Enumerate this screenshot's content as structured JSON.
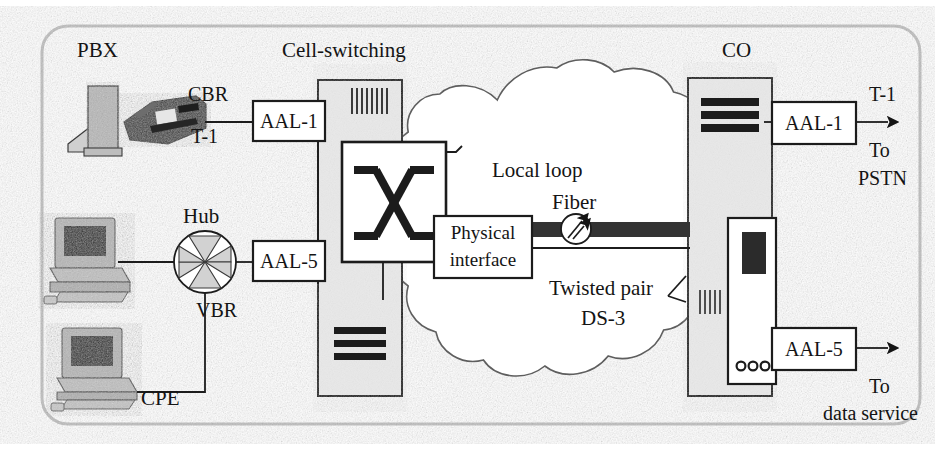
{
  "diagram": {
    "frame": {
      "style": "rounded-rectangle-border",
      "color": "#b9b9b9"
    },
    "labels": {
      "pbx": "PBX",
      "cell_switching": "Cell-switching",
      "co": "CO",
      "hub": "Hub",
      "cpe": "CPE",
      "cbr": "CBR",
      "t1_left": "T-1",
      "vbr": "VBR",
      "local_loop": "Local loop",
      "fiber": "Fiber",
      "twisted_pair": "Twisted pair",
      "ds3": "DS-3",
      "t1_right": "T-1",
      "to_pstn_line1": "To",
      "to_pstn_line2": "PSTN",
      "to_data_line1": "To",
      "to_data_line2": "data service"
    },
    "boxes": {
      "aal1_left": "AAL-1",
      "aal5_left": "AAL-5",
      "physical_interface_line1": "Physical",
      "physical_interface_line2": "interface",
      "aal1_right": "AAL-1",
      "aal5_right": "AAL-5"
    },
    "nodes": [
      {
        "name": "pbx-cabinet",
        "kind": "equipment-cabinet",
        "fill": "#b4b4b4"
      },
      {
        "name": "desk-phone",
        "kind": "telephone",
        "fill": "#3a3a3a"
      },
      {
        "name": "workstation-top",
        "kind": "desktop-computer",
        "fill": "#b0b0b0"
      },
      {
        "name": "workstation-bottom",
        "kind": "desktop-computer",
        "fill": "#b0b0b0"
      },
      {
        "name": "hub",
        "kind": "pinwheel-hub",
        "fill": "#cfcfcf"
      },
      {
        "name": "cell-switching-cabinet",
        "kind": "equipment-cabinet",
        "fill": "#e6e6e6"
      },
      {
        "name": "crossbar-switch",
        "kind": "x-switch",
        "fill": "#ffffff"
      },
      {
        "name": "local-loop-cloud",
        "kind": "network-cloud",
        "fill": "#ffffff"
      },
      {
        "name": "fiber-trunk",
        "kind": "thick-link",
        "fill": "#2e2e2e"
      },
      {
        "name": "fiber-optic-symbol",
        "kind": "optical-marker",
        "fill": "#ffffff"
      },
      {
        "name": "co-cabinet",
        "kind": "equipment-cabinet",
        "fill": "#e6e6e6"
      },
      {
        "name": "co-tower",
        "kind": "server-tower",
        "fill": "#ffffff"
      }
    ],
    "colors": {
      "line": "#141414",
      "cabinet_fill": "#e6e6e6",
      "cabinet_dark": "#b4b4b4",
      "fiber": "#2e2e2e",
      "frame": "#b9b9b9",
      "screen": "#2b2b2b"
    }
  }
}
